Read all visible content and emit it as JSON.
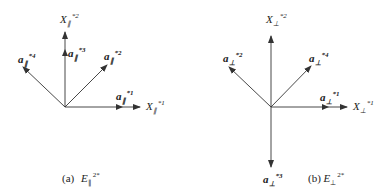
{
  "figure": {
    "panel_a": {
      "caption_prefix": "(a)",
      "caption_symbol": "E",
      "caption_sub": "∥",
      "caption_sup": "2*",
      "axes": [
        {
          "symbol": "X",
          "sub": "∥",
          "sup": "*1"
        },
        {
          "symbol": "X",
          "sub": "∥",
          "sup": "*2"
        }
      ],
      "vectors": [
        {
          "symbol": "a",
          "sub": "∥",
          "sup": "*1"
        },
        {
          "symbol": "a",
          "sub": "∥",
          "sup": "*2"
        },
        {
          "symbol": "a",
          "sub": "∥",
          "sup": "*3"
        },
        {
          "symbol": "a",
          "sub": "∥",
          "sup": "*4"
        }
      ]
    },
    "panel_b": {
      "caption_prefix": "(b)",
      "caption_symbol": "E",
      "caption_sub": "⊥",
      "caption_sup": "2*",
      "axes": [
        {
          "symbol": "X",
          "sub": "⊥",
          "sup": "*1"
        },
        {
          "symbol": "X",
          "sub": "⊥",
          "sup": "*2"
        }
      ],
      "vectors": [
        {
          "symbol": "a",
          "sub": "⊥",
          "sup": "*1"
        },
        {
          "symbol": "a",
          "sub": "⊥",
          "sup": "*2"
        },
        {
          "symbol": "a",
          "sub": "⊥",
          "sup": "*3"
        },
        {
          "symbol": "a",
          "sub": "⊥",
          "sup": "*4"
        }
      ]
    },
    "line_color": "#333333"
  }
}
